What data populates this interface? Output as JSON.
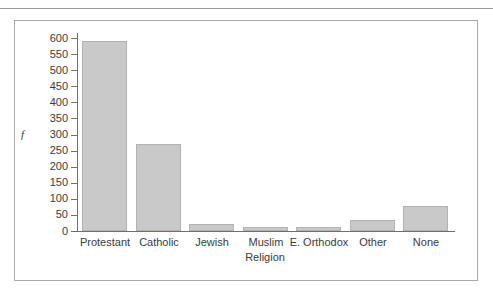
{
  "page": {
    "top_fragment_text": ""
  },
  "chart_data": {
    "type": "bar",
    "title": "",
    "subtitle": "",
    "xlabel": "Religion",
    "ylabel": "f",
    "categories": [
      "Protestant",
      "Catholic",
      "Jewish",
      "Muslim",
      "E. Orthodox",
      "Other",
      "None"
    ],
    "values": [
      590,
      270,
      22,
      13,
      13,
      35,
      78
    ],
    "ylim": [
      0,
      600
    ],
    "ytick_labels": [
      "600",
      "550",
      "500",
      "450",
      "400",
      "350",
      "300",
      "250",
      "200",
      "150",
      "100",
      "50",
      "0"
    ],
    "ytick_values": [
      600,
      550,
      500,
      450,
      400,
      350,
      300,
      250,
      200,
      150,
      100,
      50,
      0
    ],
    "grid": false,
    "legend": false,
    "legend_position": "none",
    "colors": {
      "bar_fill": "#c9c9c9",
      "bar_border": "#b2b2b2",
      "axis": "#6f6f73",
      "text": "#3a3a3e",
      "frame": "#a8a8ac",
      "background": "#ffffff"
    }
  }
}
